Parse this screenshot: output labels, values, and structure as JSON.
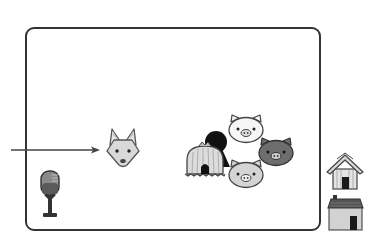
{
  "scene": {
    "type": "storyboard-illustration",
    "background": "#ffffff",
    "frame": {
      "border_color": "#333333",
      "x": 25,
      "y": 27,
      "width": 296,
      "height": 203
    }
  },
  "elements": {
    "arrow": {
      "name": "entry-arrow",
      "x1": 11,
      "y1": 150,
      "x2": 100,
      "y2": 150,
      "color": "#444444"
    },
    "fox": {
      "name": "wolf-fox-head",
      "fill": "#d9d9d9"
    },
    "microphone": {
      "name": "microphone",
      "fill": "#7a7a7a"
    },
    "straw_house": {
      "name": "straw-hut",
      "fill": "#d8d8d8"
    },
    "shadow_figure": {
      "name": "black-silhouette",
      "fill": "#111111"
    },
    "pigs": [
      {
        "name": "pig-white",
        "fill": "#f6f6f6"
      },
      {
        "name": "pig-dark",
        "fill": "#6e6e6e"
      },
      {
        "name": "pig-light",
        "fill": "#d4d4d4"
      }
    ],
    "houses": [
      {
        "name": "wooden-house",
        "fill": "#e2e2e2"
      },
      {
        "name": "brick-house",
        "fill": "#cfcfcf"
      }
    ]
  }
}
